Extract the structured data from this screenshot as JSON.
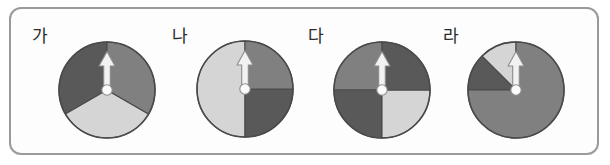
{
  "figure": {
    "type": "probability-spinners",
    "background_color": "#ffffff",
    "frame": {
      "border_color": "#9a9a9a",
      "corner_radius_px": 12,
      "fill_color": "#fdfdfd"
    },
    "palette": {
      "dark_gray": "#595959",
      "medium_gray": "#808080",
      "light_gray": "#d5d5d5",
      "outline": "#4a4a4a",
      "needle_fill": "#f2f2f2",
      "needle_outline": "#8c8c8c",
      "hub_fill": "#fbfbfb",
      "hub_outline": "#8c8c8c",
      "label_color": "#2b2b2b"
    }
  },
  "spinners": [
    {
      "label": "가",
      "label_x": 32,
      "label_y": 28,
      "cx": 107,
      "cy": 90,
      "r": 48,
      "needle_angle_deg": 0,
      "sector_count": 3,
      "sectors": [
        {
          "name": "dark-sector",
          "start_deg": 0,
          "end_deg": 120,
          "sweep_deg": 120,
          "color_key": "dark_gray",
          "color": "#595959",
          "direction": "counterclockwise",
          "fraction": "1/3"
        },
        {
          "name": "light-sector",
          "start_deg": 120,
          "end_deg": 240,
          "sweep_deg": 120,
          "color_key": "light_gray",
          "color": "#d5d5d5",
          "direction": "counterclockwise",
          "fraction": "1/3"
        },
        {
          "name": "medium-sector",
          "start_deg": 240,
          "end_deg": 360,
          "sweep_deg": 120,
          "color_key": "medium_gray",
          "color": "#808080",
          "direction": "counterclockwise",
          "fraction": "1/3"
        }
      ]
    },
    {
      "label": "나",
      "label_x": 172,
      "label_y": 28,
      "cx": 245,
      "cy": 89,
      "r": 48,
      "needle_angle_deg": 0,
      "sector_count": 3,
      "sectors": [
        {
          "name": "light-sector",
          "start_deg": 0,
          "end_deg": 180,
          "sweep_deg": 180,
          "color_key": "light_gray",
          "color": "#d5d5d5",
          "direction": "counterclockwise",
          "fraction": "1/2"
        },
        {
          "name": "dark-sector",
          "start_deg": 180,
          "end_deg": 270,
          "sweep_deg": 90,
          "color_key": "dark_gray",
          "color": "#595959",
          "direction": "counterclockwise",
          "fraction": "1/4"
        },
        {
          "name": "medium-sector",
          "start_deg": 270,
          "end_deg": 360,
          "sweep_deg": 90,
          "color_key": "medium_gray",
          "color": "#808080",
          "direction": "counterclockwise",
          "fraction": "1/4"
        }
      ]
    },
    {
      "label": "다",
      "label_x": 308,
      "label_y": 28,
      "cx": 382,
      "cy": 90,
      "r": 48,
      "needle_angle_deg": 0,
      "sector_count": 4,
      "sectors": [
        {
          "name": "medium-sector",
          "start_deg": 0,
          "end_deg": 90,
          "sweep_deg": 90,
          "color_key": "medium_gray",
          "color": "#808080",
          "direction": "counterclockwise",
          "fraction": "1/4"
        },
        {
          "name": "dark-sector-lower-left",
          "start_deg": 90,
          "end_deg": 180,
          "sweep_deg": 90,
          "color_key": "dark_gray",
          "color": "#595959",
          "direction": "counterclockwise",
          "fraction": "1/4"
        },
        {
          "name": "light-sector",
          "start_deg": 180,
          "end_deg": 270,
          "sweep_deg": 90,
          "color_key": "light_gray",
          "color": "#d5d5d5",
          "direction": "counterclockwise",
          "fraction": "1/4"
        },
        {
          "name": "dark-sector-upper-right",
          "start_deg": 270,
          "end_deg": 360,
          "sweep_deg": 90,
          "color_key": "dark_gray",
          "color": "#595959",
          "direction": "counterclockwise",
          "fraction": "1/4"
        }
      ]
    },
    {
      "label": "라",
      "label_x": 443,
      "label_y": 28,
      "cx": 516,
      "cy": 90,
      "r": 48,
      "needle_angle_deg": 0,
      "sector_count": 3,
      "sectors": [
        {
          "name": "light-sector",
          "start_deg": 0,
          "end_deg": 45,
          "sweep_deg": 45,
          "color_key": "light_gray",
          "color": "#d5d5d5",
          "direction": "counterclockwise",
          "fraction": "1/8"
        },
        {
          "name": "dark-sector",
          "start_deg": 45,
          "end_deg": 90,
          "sweep_deg": 45,
          "color_key": "dark_gray",
          "color": "#595959",
          "direction": "counterclockwise",
          "fraction": "1/8"
        },
        {
          "name": "medium-sector",
          "start_deg": 90,
          "end_deg": 360,
          "sweep_deg": 270,
          "color_key": "medium_gray",
          "color": "#808080",
          "direction": "counterclockwise",
          "fraction": "3/4"
        }
      ]
    }
  ]
}
